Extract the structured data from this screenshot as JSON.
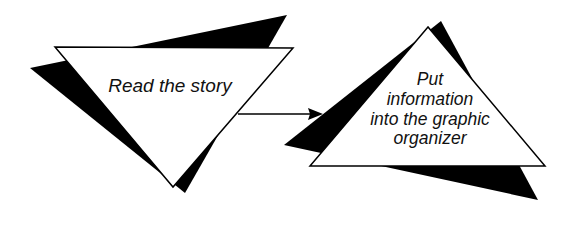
{
  "diagram": {
    "type": "flow",
    "colors": {
      "fill": "#ffffff",
      "shadow": "#000000",
      "stroke": "#000000",
      "text": "#111111"
    },
    "steps": [
      {
        "id": "step1",
        "shape": "inverted-triangle",
        "label": "Read the story"
      },
      {
        "id": "step2",
        "shape": "triangle",
        "label_lines": [
          "Put",
          "information",
          "into the graphic",
          "organizer"
        ]
      }
    ],
    "connectors": [
      {
        "from": "step1",
        "to": "step2",
        "type": "arrow"
      }
    ]
  }
}
